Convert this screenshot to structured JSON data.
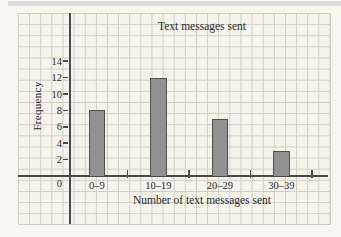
{
  "chart_data": {
    "type": "bar",
    "title": "Text messages sent",
    "xlabel": "Number of text messages sent",
    "ylabel": "Frequency",
    "categories": [
      "0–9",
      "10–19",
      "20–29",
      "30–39"
    ],
    "values": [
      8,
      12,
      7,
      3
    ],
    "yticks": [
      2,
      4,
      6,
      8,
      10,
      12,
      14
    ],
    "origin_label": "0",
    "ylim": [
      0,
      16
    ],
    "grid": true,
    "legend": "none",
    "bar_color": "#919191",
    "bar_border_color": "#4f4f4f",
    "axis_color": "#4a4a4a",
    "grid_color": "#cfccc2",
    "paper_color": "#f5f3ea"
  }
}
